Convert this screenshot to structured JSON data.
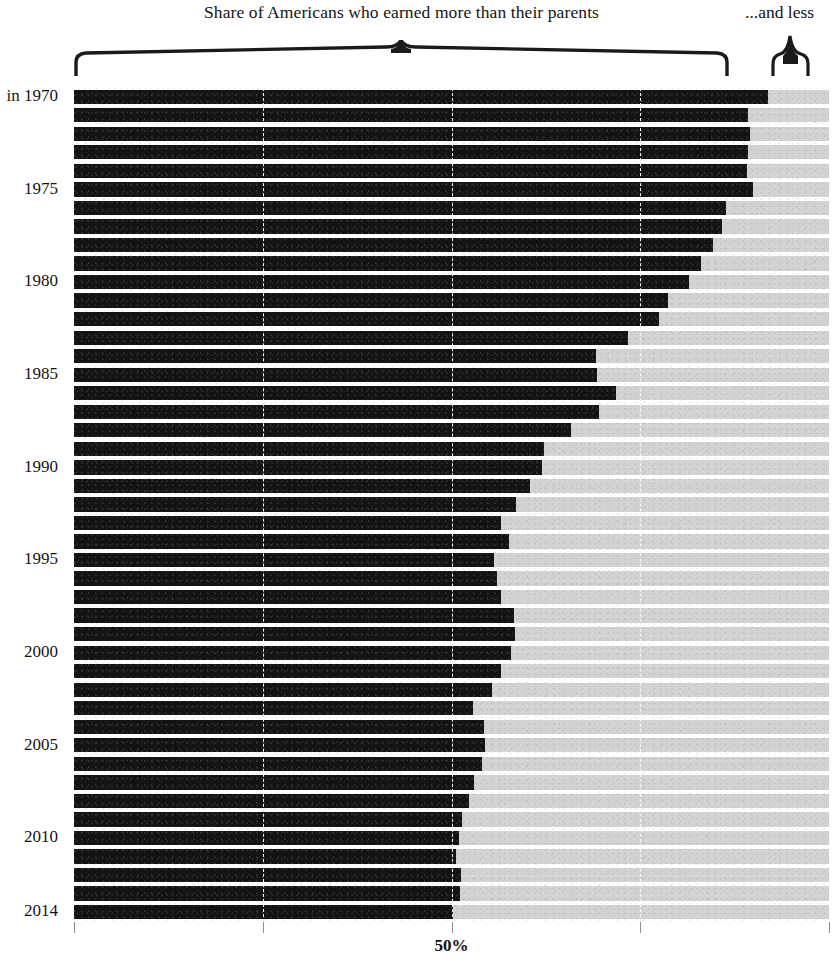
{
  "header": {
    "title_left": "Share of Americans who earned more than their parents",
    "title_right": "...and less",
    "brace_left_icon": "curly-brace-wide-icon",
    "brace_right_icon": "curly-brace-narrow-icon"
  },
  "axis": {
    "x_tick_label_50": "50%",
    "y_first_label": "in 1970",
    "y_labels": [
      "in 1970",
      "1975",
      "1980",
      "1985",
      "1990",
      "1995",
      "2000",
      "2005",
      "2010",
      "2014"
    ]
  },
  "colors": {
    "fill": "#141414",
    "track": "#d2d2d2",
    "gridline": "#f4f4f4",
    "text": "#141414",
    "background": "#ffffff"
  },
  "chart_data": {
    "type": "bar",
    "orientation": "horizontal",
    "stacked": true,
    "title": "Share of Americans who earned more than their parents",
    "xlabel": "",
    "ylabel": "",
    "xlim": [
      0,
      100
    ],
    "xticks": [
      0,
      25,
      50,
      75,
      100
    ],
    "xtick_labels": [
      "",
      "",
      "50%",
      "",
      ""
    ],
    "grid": true,
    "gridline_positions": [
      25,
      50,
      75
    ],
    "legend": [
      "Share of Americans who earned more than their parents",
      "...and less"
    ],
    "legend_position": "top",
    "categories": [
      "1970",
      "1971",
      "1972",
      "1973",
      "1974",
      "1975",
      "1976",
      "1977",
      "1978",
      "1979",
      "1980",
      "1981",
      "1982",
      "1983",
      "1984",
      "1985",
      "1986",
      "1987",
      "1988",
      "1989",
      "1990",
      "1991",
      "1992",
      "1993",
      "1994",
      "1995",
      "1996",
      "1997",
      "1998",
      "1999",
      "2000",
      "2001",
      "2002",
      "2003",
      "2004",
      "2005",
      "2006",
      "2007",
      "2008",
      "2009",
      "2010",
      "2011",
      "2012",
      "2013",
      "2014"
    ],
    "series": [
      {
        "name": "earned more than their parents",
        "values": [
          91.9,
          89.3,
          89.5,
          89.3,
          89.1,
          89.9,
          86.3,
          85.8,
          84.6,
          83.0,
          81.5,
          78.7,
          77.5,
          73.4,
          69.2,
          69.3,
          71.8,
          69.6,
          65.8,
          62.2,
          62.0,
          60.4,
          58.5,
          56.6,
          57.6,
          55.6,
          56.0,
          56.6,
          58.3,
          58.4,
          57.9,
          56.5,
          55.3,
          52.8,
          54.3,
          54.5,
          54.1,
          53.0,
          52.3,
          51.4,
          51.0,
          50.6,
          51.3,
          51.1,
          50.2
        ]
      },
      {
        "name": "...and less",
        "values": [
          8.1,
          10.7,
          10.5,
          10.7,
          10.9,
          10.1,
          13.7,
          14.2,
          15.4,
          17.0,
          18.5,
          21.3,
          22.5,
          26.6,
          30.8,
          30.7,
          28.2,
          30.4,
          34.2,
          37.8,
          38.0,
          39.6,
          41.5,
          43.4,
          42.4,
          44.4,
          44.0,
          43.4,
          41.7,
          41.6,
          42.1,
          43.5,
          44.7,
          47.2,
          45.7,
          45.5,
          45.9,
          47.0,
          47.7,
          48.6,
          49.0,
          49.4,
          48.7,
          48.9,
          49.8
        ]
      }
    ]
  }
}
